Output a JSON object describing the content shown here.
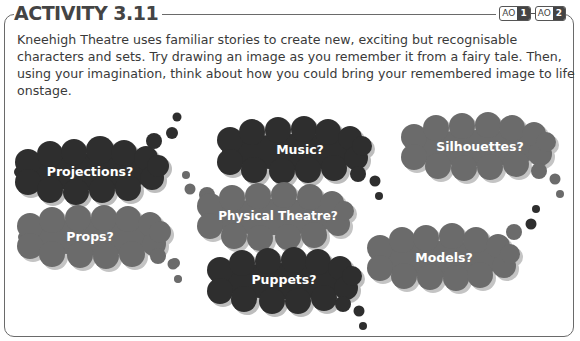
{
  "activity": {
    "title": "ACTIVITY 3.11",
    "assessment_objectives": [
      {
        "label": "AO",
        "number": "1"
      },
      {
        "label": "AO",
        "number": "2"
      }
    ],
    "instructions": "Kneehigh Theatre uses familiar stories to create new, exciting but recognisable characters and sets. Try drawing an image as you remember it from a fairy tale. Then, using your imagination, think about how you could bring your remembered image to life onstage."
  },
  "bubbles": [
    {
      "label": "Projections?",
      "shade": "dark"
    },
    {
      "label": "Props?",
      "shade": "medium"
    },
    {
      "label": "Music?",
      "shade": "dark"
    },
    {
      "label": "Physical Theatre?",
      "shade": "medium"
    },
    {
      "label": "Puppets?",
      "shade": "dark"
    },
    {
      "label": "Silhouettes?",
      "shade": "medium"
    },
    {
      "label": "Models?",
      "shade": "medium"
    }
  ],
  "colors": {
    "dark": "#2e2e2e",
    "medium": "#6b6b6b",
    "shadow": "#b8b8b8",
    "frame": "#6a6a6a"
  }
}
